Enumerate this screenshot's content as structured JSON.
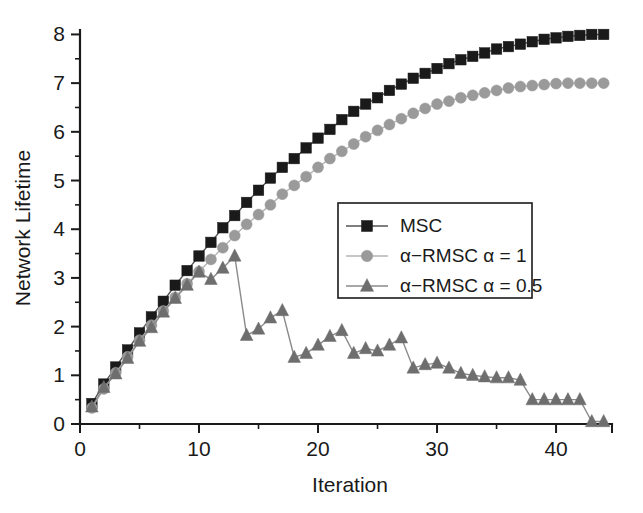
{
  "chart_data": {
    "type": "line",
    "title": "",
    "xlabel": "Iteration",
    "ylabel": "Network Lifetime",
    "xlim": [
      0,
      44.7
    ],
    "ylim": [
      0,
      8.05
    ],
    "xticks": [
      0,
      10,
      20,
      30,
      40
    ],
    "xtick_labels": [
      "0",
      "10",
      "20",
      "30",
      "40"
    ],
    "x_minor_ticks": [
      5,
      15,
      25,
      35
    ],
    "yticks": [
      0,
      1,
      2,
      3,
      4,
      5,
      6,
      7,
      8
    ],
    "ytick_labels": [
      "0",
      "1",
      "2",
      "3",
      "4",
      "5",
      "6",
      "7",
      "8"
    ],
    "y_minor_ticks": [
      0.5,
      1.5,
      2.5,
      3.5,
      4.5,
      5.5,
      6.5,
      7.5
    ],
    "grid": false,
    "legend_position": "center-right",
    "series": [
      {
        "name": "MSC",
        "marker": "square",
        "color": "#1a1a1a",
        "line_color": "#555555",
        "x": [
          1,
          2,
          3,
          4,
          5,
          6,
          7,
          8,
          9,
          10,
          11,
          12,
          13,
          14,
          15,
          16,
          17,
          18,
          19,
          20,
          21,
          22,
          23,
          24,
          25,
          26,
          27,
          28,
          29,
          30,
          31,
          32,
          33,
          34,
          35,
          36,
          37,
          38,
          39,
          40,
          41,
          42,
          43,
          44
        ],
        "values": [
          0.42,
          0.82,
          1.17,
          1.52,
          1.87,
          2.2,
          2.52,
          2.85,
          3.15,
          3.45,
          3.73,
          4.03,
          4.28,
          4.55,
          4.8,
          5.05,
          5.27,
          5.45,
          5.67,
          5.87,
          6.05,
          6.25,
          6.42,
          6.57,
          6.7,
          6.85,
          6.98,
          7.1,
          7.2,
          7.3,
          7.4,
          7.48,
          7.55,
          7.62,
          7.7,
          7.75,
          7.8,
          7.85,
          7.9,
          7.93,
          7.96,
          7.98,
          8.0,
          8.0
        ]
      },
      {
        "name": "α−RMSC α = 1",
        "marker": "circle",
        "color": "#9a9a9a",
        "line_color": "#b5b5b5",
        "x": [
          1,
          2,
          3,
          4,
          5,
          6,
          7,
          8,
          9,
          10,
          11,
          12,
          13,
          14,
          15,
          16,
          17,
          18,
          19,
          20,
          21,
          22,
          23,
          24,
          25,
          26,
          27,
          28,
          29,
          30,
          31,
          32,
          33,
          34,
          35,
          36,
          37,
          38,
          39,
          40,
          41,
          42,
          43,
          44
        ],
        "values": [
          0.33,
          0.72,
          1.05,
          1.38,
          1.72,
          2.03,
          2.32,
          2.6,
          2.88,
          3.13,
          3.38,
          3.62,
          3.87,
          4.1,
          4.3,
          4.5,
          4.72,
          4.9,
          5.08,
          5.27,
          5.45,
          5.6,
          5.75,
          5.9,
          6.03,
          6.15,
          6.27,
          6.38,
          6.48,
          6.57,
          6.63,
          6.7,
          6.75,
          6.8,
          6.85,
          6.9,
          6.93,
          6.95,
          6.97,
          6.99,
          7.0,
          7.0,
          7.0,
          7.0
        ]
      },
      {
        "name": "α−RMSC α = 0.5",
        "marker": "triangle",
        "color": "#6e6e6e",
        "line_color": "#8a8a8a",
        "x": [
          1,
          2,
          3,
          4,
          5,
          6,
          7,
          8,
          9,
          10,
          11,
          12,
          13,
          14,
          15,
          16,
          17,
          18,
          19,
          20,
          21,
          22,
          23,
          24,
          25,
          26,
          27,
          28,
          29,
          30,
          31,
          32,
          33,
          34,
          35,
          36,
          37,
          38,
          39,
          40,
          41,
          42,
          43,
          44
        ],
        "values": [
          0.35,
          0.75,
          1.03,
          1.35,
          1.7,
          1.98,
          2.3,
          2.58,
          2.85,
          3.12,
          2.97,
          3.2,
          3.45,
          1.82,
          1.95,
          2.18,
          2.33,
          1.37,
          1.45,
          1.62,
          1.8,
          1.92,
          1.45,
          1.55,
          1.5,
          1.62,
          1.77,
          1.15,
          1.22,
          1.25,
          1.15,
          1.04,
          1.0,
          0.97,
          0.95,
          0.95,
          0.9,
          0.5,
          0.5,
          0.5,
          0.5,
          0.5,
          0.05,
          0.05
        ]
      }
    ]
  },
  "legend": {
    "entries": [
      {
        "label": "MSC"
      },
      {
        "label": "α−RMSC α = 1"
      },
      {
        "label": "α−RMSC α = 0.5"
      }
    ]
  }
}
